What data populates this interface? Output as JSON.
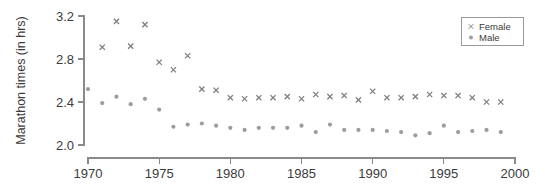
{
  "chart_data": {
    "type": "scatter",
    "title": "",
    "xlabel": "",
    "ylabel": "Marathon times (in hrs)",
    "xlim": [
      1970,
      2000
    ],
    "ylim": [
      2.0,
      3.2
    ],
    "xticks": [
      1970,
      1975,
      1980,
      1985,
      1990,
      1995,
      2000
    ],
    "xticklabels": [
      "1970",
      "1975",
      "1980",
      "1985",
      "1990",
      "1995",
      "2000"
    ],
    "yticks": [
      2.0,
      2.4,
      2.8,
      3.2
    ],
    "yticklabels": [
      "2.0",
      "2.4",
      "2.8",
      "3.2"
    ],
    "grid": false,
    "legend_position": "top-right",
    "x": [
      1970,
      1971,
      1972,
      1973,
      1974,
      1975,
      1976,
      1977,
      1978,
      1979,
      1980,
      1981,
      1982,
      1983,
      1984,
      1985,
      1986,
      1987,
      1988,
      1989,
      1990,
      1991,
      1992,
      1993,
      1994,
      1995,
      1996,
      1997,
      1998,
      1999
    ],
    "series": [
      {
        "name": "Female",
        "marker": "x",
        "color": "#7d7d7d",
        "values": [
          null,
          2.91,
          3.15,
          2.92,
          3.12,
          2.77,
          2.7,
          2.83,
          2.52,
          2.51,
          2.44,
          2.43,
          2.44,
          2.44,
          2.45,
          2.43,
          2.47,
          2.45,
          2.46,
          2.42,
          2.5,
          2.44,
          2.44,
          2.45,
          2.47,
          2.46,
          2.46,
          2.44,
          2.4,
          2.4
        ]
      },
      {
        "name": "Male",
        "marker": "circle",
        "color": "#9d9d9d",
        "values": [
          2.52,
          2.39,
          2.45,
          2.38,
          2.43,
          2.33,
          2.17,
          2.19,
          2.2,
          2.18,
          2.16,
          2.14,
          2.16,
          2.16,
          2.16,
          2.18,
          2.12,
          2.19,
          2.14,
          2.14,
          2.14,
          2.13,
          2.12,
          2.09,
          2.11,
          2.18,
          2.12,
          2.13,
          2.14,
          2.12
        ]
      }
    ]
  },
  "legend": {
    "entries": [
      {
        "label": "Female",
        "marker": "x-marker"
      },
      {
        "label": "Male",
        "marker": "dot-marker"
      }
    ]
  }
}
